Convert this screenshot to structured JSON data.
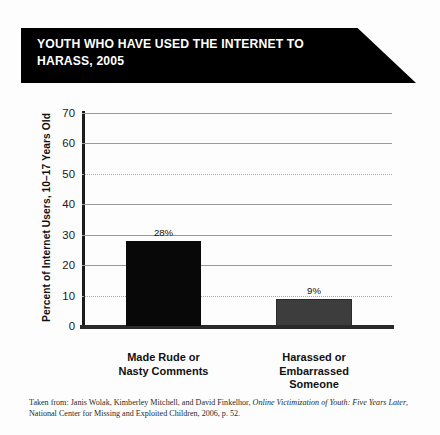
{
  "banner": {
    "title": "YOUTH WHO HAVE USED THE INTERNET TO\nHARASS, 2005"
  },
  "chart_data": {
    "type": "bar",
    "title": "YOUTH WHO HAVE USED THE INTERNET TO HARASS, 2005",
    "categories": [
      "Made Rude or\nNasty Comments",
      "Harassed or\nEmbarrassed\nSomeone"
    ],
    "values": [
      28,
      9
    ],
    "value_labels": [
      "28%",
      "9%"
    ],
    "series": [
      {
        "name": "Percent of Internet Users, 10-17 Years Old",
        "values": [
          28,
          9
        ],
        "colors": [
          "#080808",
          "#3d3d3d"
        ]
      }
    ],
    "xlabel": "",
    "ylabel": "Percent of Internet Users, 10–17 Years Old",
    "ylim": [
      0,
      70
    ],
    "yticks": [
      0,
      10,
      20,
      30,
      40,
      50,
      60,
      70
    ],
    "ytick_labels": [
      "0",
      "10",
      "20",
      "30",
      "40",
      "50",
      "60",
      "70"
    ],
    "grid": true,
    "legend": "none"
  },
  "source": {
    "prefix": "Taken from: Janis Wolak, Kimberley Mitchell, and David Finkelhor, ",
    "work_title": "Online Victimization of Youth: Five Years Later",
    "suffix": ", National Center for Missing and Exploited Children, 2006, p. 52."
  },
  "colors": {
    "banner_background": "#000000",
    "banner_text": "#ffffff",
    "bar_primary": "#080808",
    "bar_secondary": "#3d3d3d",
    "axis": "#1c1c1c",
    "gridline": "#9a9a9a",
    "page_background": "#fdfdfd"
  }
}
